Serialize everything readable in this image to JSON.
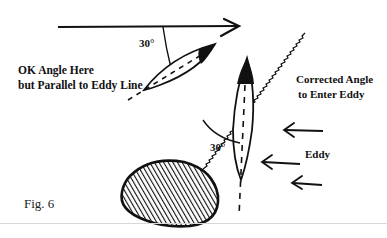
{
  "figure": {
    "caption": "Fig. 6",
    "labels": {
      "ok_angle_line1": "OK Angle Here",
      "ok_angle_line2": "but Parallel to Eddy Line",
      "corrected_line1": "Corrected Angle",
      "corrected_line2": "to Enter Eddy",
      "eddy": "Eddy",
      "angle_upper": "30°",
      "angle_lower": "30°"
    },
    "elements": {
      "current_arrow": "main-current-arrow (left to right)",
      "eddy_line": "wavy-eddy-line",
      "upper_boat": "boat-angled-parallel-to-eddy-line",
      "lower_boat": "boat-corrected-angle",
      "rock": "hatched-rock",
      "eddy_arrows": 3
    },
    "colors": {
      "ink": "#111111",
      "background": "#ffffff"
    }
  }
}
